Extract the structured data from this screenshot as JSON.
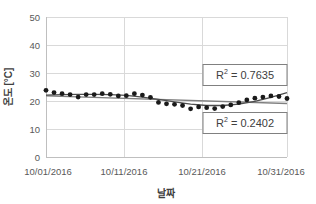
{
  "chart_data": {
    "type": "scatter",
    "title": "",
    "xlabel": "날짜",
    "ylabel": "온도 [°C]",
    "xlim": [
      0,
      30
    ],
    "ylim": [
      0,
      50
    ],
    "grid": true,
    "legend_position": "none",
    "x_tick_labels": [
      "10/01/2016",
      "10/11/2016",
      "10/21/2016",
      "10/31/2016"
    ],
    "x_tick_values": [
      0,
      10,
      20,
      30
    ],
    "y_tick_labels": [
      "0",
      "10",
      "20",
      "30",
      "40",
      "50"
    ],
    "y_tick_values": [
      0,
      10,
      20,
      30,
      40,
      50
    ],
    "series": [
      {
        "name": "온도",
        "marker": "circle",
        "color": "#1a1a1a",
        "x": [
          0,
          1,
          2,
          3,
          4,
          5,
          6,
          7,
          8,
          9,
          10,
          11,
          12,
          13,
          14,
          15,
          16,
          17,
          18,
          19,
          20,
          21,
          22,
          23,
          24,
          25,
          26,
          27,
          28,
          29,
          30
        ],
        "values": [
          23.8,
          23.0,
          22.6,
          22.3,
          21.4,
          22.3,
          22.3,
          22.6,
          22.4,
          21.8,
          21.9,
          22.6,
          22.1,
          21.3,
          19.5,
          19.0,
          18.8,
          18.4,
          17.2,
          17.9,
          17.6,
          17.3,
          18.0,
          18.6,
          19.4,
          20.4,
          21.0,
          21.4,
          21.8,
          21.6,
          20.9
        ]
      },
      {
        "name": "다항식 추세선",
        "type": "line",
        "color": "#4d4d4d",
        "x": [
          0,
          2,
          4,
          6,
          8,
          10,
          12,
          14,
          16,
          18,
          20,
          22,
          24,
          26,
          28,
          30
        ],
        "values": [
          22.1,
          22.3,
          22.4,
          22.4,
          22.3,
          22.0,
          21.4,
          20.6,
          19.7,
          18.9,
          18.4,
          18.4,
          18.9,
          19.9,
          21.3,
          23.0
        ]
      },
      {
        "name": "선형 추세선",
        "type": "line",
        "color": "#808080",
        "x": [
          0,
          30
        ],
        "values": [
          21.8,
          19.1
        ]
      }
    ],
    "annotations": [
      {
        "id": "r2-poly",
        "label": "R² = 0.7635",
        "r_symbol": "R",
        "exponent": "2",
        "equals": "=",
        "value": "0.7635",
        "x": 24.3,
        "y": 29.5
      },
      {
        "id": "r2-linear",
        "label": "R² = 0.2402",
        "r_symbol": "R",
        "exponent": "2",
        "equals": "=",
        "value": "0.2402",
        "x": 24.3,
        "y": 12.3
      }
    ]
  },
  "colors": {
    "gridline": "#d9d9d9",
    "axis": "#bfbfbf",
    "marker": "#1a1a1a",
    "trend_polynomial": "#4d4d4d",
    "trend_linear": "#808080",
    "annotation_border": "#808080",
    "text": "#595959",
    "background": "#ffffff"
  }
}
